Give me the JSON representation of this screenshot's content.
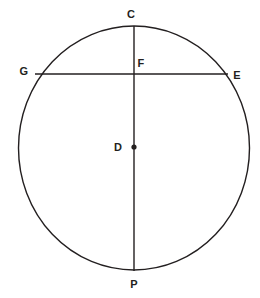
{
  "figure": {
    "background_color": "#ffffff",
    "stroke_color": "#231f20",
    "label_color": "#231f20"
  },
  "circle": {
    "name": "circle-D",
    "center_label": "D",
    "center_x": 134,
    "center_y": 148,
    "radius_x": 115.5,
    "radius_y": 122,
    "stroke_width": 1.4
  },
  "segments": [
    {
      "name": "diameter-CP",
      "from": "C",
      "to": "P",
      "x1": 134,
      "y1": 26,
      "x2": 134,
      "y2": 271,
      "stroke_width": 1.4,
      "orientation": "vertical"
    },
    {
      "name": "chord-GE",
      "from": "G",
      "to": "E",
      "x1": 35,
      "y1": 74,
      "x2": 228,
      "y2": 74,
      "stroke_width": 1.4,
      "orientation": "horizontal"
    }
  ],
  "points": [
    {
      "id": "C",
      "label": "C",
      "x": 134,
      "y": 28,
      "label_x": 131,
      "label_y": 14,
      "dot": false,
      "on_circle": true
    },
    {
      "id": "F",
      "label": "F",
      "x": 134,
      "y": 74,
      "label_x": 141,
      "label_y": 63,
      "dot": false,
      "on_circle": false
    },
    {
      "id": "G",
      "label": "G",
      "x": 35,
      "y": 74,
      "label_x": 24,
      "label_y": 71,
      "dot": false,
      "on_circle": true
    },
    {
      "id": "E",
      "label": "E",
      "x": 228,
      "y": 74,
      "label_x": 237,
      "label_y": 75,
      "dot": false,
      "on_circle": true
    },
    {
      "id": "D",
      "label": "D",
      "x": 134,
      "y": 147,
      "label_x": 118,
      "label_y": 147,
      "dot": true,
      "dot_radius": 2.6,
      "on_circle": false
    },
    {
      "id": "P",
      "label": "P",
      "x": 134,
      "y": 271,
      "label_x": 134,
      "label_y": 284,
      "dot": false,
      "on_circle": true
    }
  ]
}
